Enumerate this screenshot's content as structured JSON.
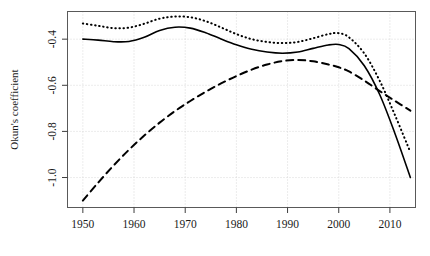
{
  "chart_data": {
    "type": "line",
    "title": "",
    "xlabel": "",
    "ylabel": "Okun's coefficient",
    "xlim": [
      1947,
      2015
    ],
    "ylim": [
      -1.13,
      -0.28
    ],
    "grid": true,
    "legend_position": "none",
    "xticks": [
      1950,
      1960,
      1970,
      1980,
      1990,
      2000,
      2010
    ],
    "xtick_labels": [
      "1950",
      "1960",
      "1970",
      "1980",
      "1990",
      "2000",
      "2010"
    ],
    "yticks": [
      -0.4,
      -0.6,
      -0.8,
      -1.0
    ],
    "ytick_labels": [
      "-0.4",
      "-0.6",
      "-0.8",
      "-1.0"
    ],
    "series": [
      {
        "name": "solid",
        "style": "solid",
        "color": "#000000",
        "x": [
          1950,
          1953,
          1956,
          1959,
          1962,
          1965,
          1968,
          1971,
          1974,
          1977,
          1980,
          1983,
          1986,
          1989,
          1992,
          1995,
          1998,
          2000,
          2002,
          2005,
          2008,
          2011,
          2014
        ],
        "y": [
          -0.4,
          -0.404,
          -0.411,
          -0.41,
          -0.392,
          -0.362,
          -0.348,
          -0.352,
          -0.372,
          -0.399,
          -0.424,
          -0.444,
          -0.456,
          -0.461,
          -0.456,
          -0.44,
          -0.425,
          -0.423,
          -0.441,
          -0.515,
          -0.64,
          -0.81,
          -1.0
        ]
      },
      {
        "name": "dotted",
        "style": "dotted",
        "color": "#000000",
        "x": [
          1950,
          1953,
          1956,
          1959,
          1962,
          1965,
          1968,
          1971,
          1974,
          1977,
          1980,
          1983,
          1986,
          1989,
          1992,
          1995,
          1998,
          2000,
          2002,
          2005,
          2008,
          2011,
          2014
        ],
        "y": [
          -0.332,
          -0.342,
          -0.352,
          -0.35,
          -0.333,
          -0.311,
          -0.302,
          -0.305,
          -0.322,
          -0.349,
          -0.378,
          -0.4,
          -0.412,
          -0.417,
          -0.412,
          -0.396,
          -0.378,
          -0.374,
          -0.392,
          -0.462,
          -0.58,
          -0.73,
          -0.89
        ]
      },
      {
        "name": "dashed",
        "style": "dashed",
        "color": "#000000",
        "x": [
          1950,
          1953,
          1956,
          1959,
          1962,
          1965,
          1968,
          1971,
          1974,
          1977,
          1980,
          1983,
          1986,
          1989,
          1992,
          1995,
          1998,
          2000,
          2002,
          2005,
          2008,
          2011,
          2014
        ],
        "y": [
          -1.1,
          -1.022,
          -0.948,
          -0.88,
          -0.818,
          -0.762,
          -0.712,
          -0.668,
          -0.628,
          -0.592,
          -0.56,
          -0.532,
          -0.51,
          -0.495,
          -0.49,
          -0.496,
          -0.51,
          -0.522,
          -0.54,
          -0.58,
          -0.625,
          -0.668,
          -0.71
        ]
      }
    ]
  }
}
